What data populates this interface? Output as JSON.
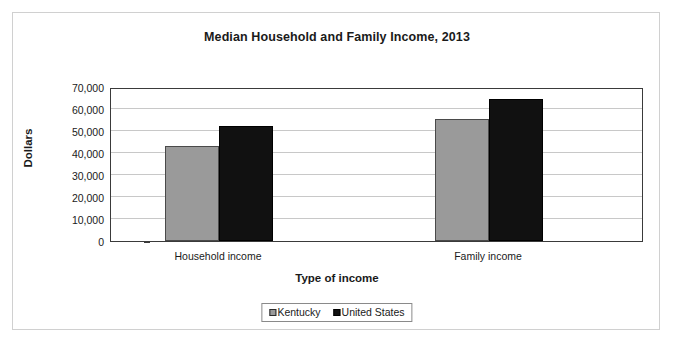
{
  "chart_data": {
    "type": "bar",
    "title": "Median Household and Family Income, 2013",
    "xlabel": "Type of income",
    "ylabel": "Dollars",
    "categories": [
      "Household income",
      "Family income"
    ],
    "series": [
      {
        "name": "Kentucky",
        "color": "#9a9a9a",
        "values": [
          43000,
          55500
        ]
      },
      {
        "name": "United States",
        "color": "#111111",
        "values": [
          52500,
          64500
        ]
      }
    ],
    "ylim": [
      0,
      70000
    ],
    "ytick_values": [
      0,
      10000,
      20000,
      30000,
      40000,
      50000,
      60000,
      70000
    ],
    "ytick_labels": [
      "0",
      "10,000",
      "20,000",
      "30,000",
      "40,000",
      "50,000",
      "60,000",
      "70,000"
    ],
    "grid": true,
    "legend_position": "bottom"
  }
}
